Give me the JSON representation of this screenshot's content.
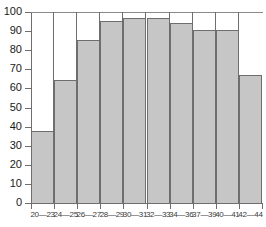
{
  "chart_data": {
    "type": "bar",
    "title": "",
    "subtitle": "",
    "xlabel": "",
    "ylabel": "",
    "categories": [
      "20—23",
      "24—25",
      "26—27",
      "28—29",
      "30—31",
      "32—33",
      "34—36",
      "37—39",
      "40—41",
      "42—44"
    ],
    "values": [
      37.5,
      64.5,
      85.5,
      95.5,
      97,
      97,
      94.5,
      90.5,
      90.5,
      67
    ],
    "ylim": [
      0,
      100
    ],
    "xlim": [
      0,
      10
    ],
    "y_ticks": [
      0,
      10,
      20,
      30,
      40,
      50,
      60,
      70,
      80,
      90,
      100
    ],
    "y_tick_labels": [
      "0",
      "10",
      "20",
      "30",
      "40",
      "50",
      "60",
      "70",
      "80",
      "90",
      "100"
    ],
    "grid": false,
    "legend": null,
    "legend_position": "none",
    "annotations": [],
    "colors": {
      "bar_fill": "#c6c6c6",
      "bar_edge": "#6e6e6e",
      "axis": "#6e6e6e",
      "text": "#1a1a1a",
      "background": "#ffffff"
    }
  }
}
